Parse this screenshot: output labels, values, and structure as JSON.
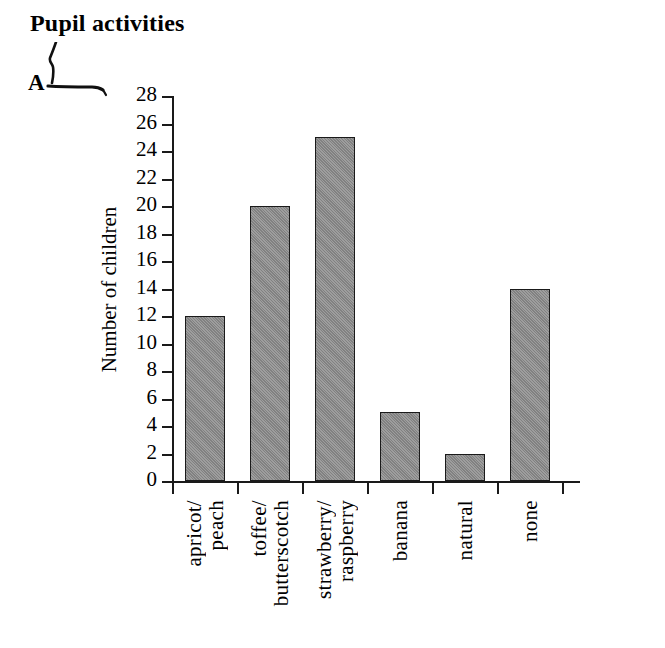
{
  "title": "Pupil activities",
  "annotation": {
    "letter": "A",
    "icon": "handwritten-pen-stroke"
  },
  "chart_data": {
    "type": "bar",
    "title": "Pupil activities",
    "xlabel": "",
    "ylabel": "Number of children",
    "categories": [
      "apricot/ peach",
      "toffee/ butterscotch",
      "strawberry/ raspberry",
      "banana",
      "natural",
      "none"
    ],
    "category_lines": [
      [
        "apricot/",
        "peach"
      ],
      [
        "toffee/",
        "butterscotch"
      ],
      [
        "strawberry/",
        "raspberry"
      ],
      [
        "banana"
      ],
      [
        "natural"
      ],
      [
        "none"
      ]
    ],
    "values": [
      12,
      20,
      25,
      5,
      2,
      14
    ],
    "ylim": [
      0,
      28
    ],
    "ytick_step": 2,
    "yticks": [
      0,
      2,
      4,
      6,
      8,
      10,
      12,
      14,
      16,
      18,
      20,
      22,
      24,
      26,
      28
    ],
    "ytick_labels": [
      "0",
      "2",
      "4",
      "6",
      "8",
      "10",
      "12",
      "14",
      "16",
      "18",
      "20",
      "22",
      "24",
      "26",
      "28"
    ],
    "grid": false,
    "legend": null,
    "bar_fill_color": "#8b8b8b",
    "bar_edge_color": "#1a1a1a",
    "axis_color": "#1a1a1a",
    "background_color": "#ffffff"
  }
}
